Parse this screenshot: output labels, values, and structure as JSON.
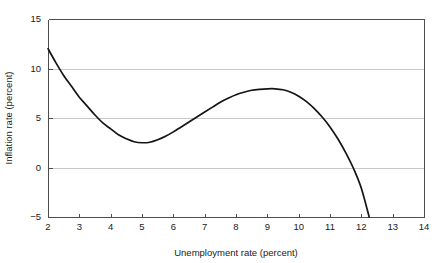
{
  "chart_data": {
    "type": "line",
    "title": "",
    "subtitle": "",
    "xlabel": "Unemployment rate (percent)",
    "ylabel": "Inflation rate (percent)",
    "xlim": [
      2,
      14
    ],
    "ylim": [
      -5,
      15
    ],
    "xticks": [
      2,
      3,
      4,
      5,
      6,
      7,
      8,
      9,
      10,
      11,
      12,
      13,
      14
    ],
    "yticks": [
      -5,
      0,
      5,
      10,
      15
    ],
    "xtick_labels": [
      "2",
      "3",
      "4",
      "5",
      "6",
      "7",
      "8",
      "9",
      "10",
      "11",
      "12",
      "13",
      "14"
    ],
    "ytick_labels": [
      "-5",
      "0",
      "5",
      "10",
      "15"
    ],
    "grid": true,
    "grid_axis": "y",
    "legend": null,
    "legend_position": "none",
    "annotations": [],
    "series": [
      {
        "name": "Inflation vs unemployment",
        "color": "#141414",
        "x": [
          2.0,
          2.25,
          2.5,
          2.75,
          3.0,
          3.25,
          3.5,
          3.75,
          4.0,
          4.25,
          4.5,
          4.75,
          5.0,
          5.25,
          5.5,
          5.75,
          6.0,
          6.25,
          6.5,
          6.75,
          7.0,
          7.25,
          7.5,
          7.75,
          8.0,
          8.25,
          8.5,
          8.75,
          9.0,
          9.25,
          9.5,
          9.75,
          10.0,
          10.25,
          10.5,
          10.75,
          11.0,
          11.25,
          11.5,
          11.75,
          12.0,
          12.25
        ],
        "y": [
          12.0,
          10.6,
          9.3,
          8.2,
          7.1,
          6.2,
          5.3,
          4.5,
          3.9,
          3.3,
          2.9,
          2.6,
          2.5,
          2.55,
          2.8,
          3.15,
          3.6,
          4.1,
          4.6,
          5.1,
          5.6,
          6.1,
          6.6,
          7.0,
          7.35,
          7.6,
          7.8,
          7.9,
          7.95,
          7.95,
          7.85,
          7.6,
          7.2,
          6.65,
          5.95,
          5.1,
          4.1,
          2.9,
          1.5,
          -0.1,
          -2.1,
          -5.0
        ]
      }
    ],
    "key_points": {
      "start": {
        "x": 2.0,
        "y": 12.0,
        "label": "curve start"
      },
      "local_minimum": {
        "x": 5.0,
        "y": 2.5,
        "label": "local minimum"
      },
      "local_maximum": {
        "x": 9.1,
        "y": 8.0,
        "label": "local maximum"
      },
      "zero_crossing": {
        "x": 11.75,
        "y": 0.0,
        "label": "inflation zero crossing"
      },
      "end": {
        "x": 12.25,
        "y": -5.0,
        "label": "curve end"
      }
    }
  },
  "axes": {
    "x_title": "Unemployment rate (percent)",
    "y_title": "Inflation rate (percent)"
  },
  "colors": {
    "curve": "#141414",
    "grid": "#c9c9c9",
    "axis": "#4d4d4d",
    "text": "#1a1a1a",
    "background": "#ffffff"
  }
}
